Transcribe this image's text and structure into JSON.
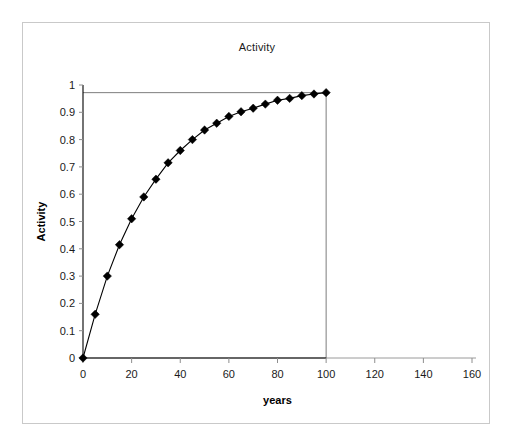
{
  "chart_data": {
    "type": "line",
    "title": "Activity",
    "xlabel": "years",
    "ylabel": "Activity",
    "xlim": [
      0,
      160
    ],
    "ylim": [
      0,
      1
    ],
    "xticks": [
      0,
      20,
      40,
      60,
      80,
      100,
      120,
      140,
      160
    ],
    "xtick_labels": [
      "0",
      "20",
      "40",
      "60",
      "80",
      "100",
      "120",
      "140",
      "160"
    ],
    "yticks": [
      0,
      0.1,
      0.2,
      0.3,
      0.4,
      0.5,
      0.6,
      0.7,
      0.8,
      0.9,
      1
    ],
    "ytick_labels": [
      "0",
      "0.1",
      "0.2",
      "0.3",
      "0.4",
      "0.5",
      "0.6",
      "0.7",
      "0.8",
      "0.9",
      "1"
    ],
    "grid": false,
    "legend": false,
    "marker": "diamond",
    "marker_color": "#000000",
    "line_color": "#000000",
    "plot_background": "#ffffff",
    "frame_color": "#c9c9c9",
    "series": [
      {
        "name": "Activity",
        "x": [
          0,
          5,
          10,
          15,
          20,
          25,
          30,
          35,
          40,
          45,
          50,
          55,
          60,
          65,
          70,
          75,
          80,
          85,
          90,
          95,
          100
        ],
        "values": [
          0,
          0.16,
          0.3,
          0.415,
          0.51,
          0.59,
          0.655,
          0.715,
          0.76,
          0.8,
          0.835,
          0.86,
          0.885,
          0.902,
          0.915,
          0.93,
          0.944,
          0.951,
          0.961,
          0.967,
          0.972
        ]
      }
    ]
  }
}
